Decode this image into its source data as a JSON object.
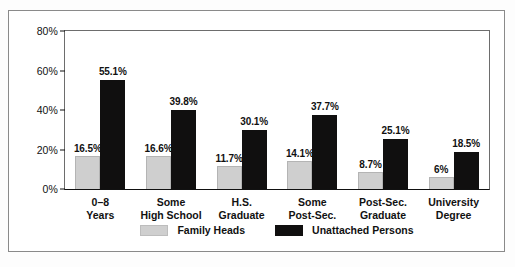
{
  "chart_data": {
    "type": "bar",
    "title": "",
    "subtitle": "",
    "xlabel": "",
    "ylabel": "",
    "ylim": [
      0,
      80
    ],
    "y_ticks": [
      0,
      20,
      40,
      60,
      80
    ],
    "y_tick_labels": [
      "0%",
      "20%",
      "40%",
      "60%",
      "80%"
    ],
    "grid": false,
    "legend_position": "bottom-center",
    "categories": [
      "0–8\nYears",
      "Some\nHigh School",
      "H.S.\nGraduate",
      "Some\nPost-Sec.",
      "Post-Sec.\nGraduate",
      "University\nDegree"
    ],
    "series": [
      {
        "name": "Family Heads",
        "color": "#cfcfcf",
        "values": [
          16.5,
          16.6,
          11.7,
          14.1,
          8.7,
          6.0
        ],
        "value_labels": [
          "16.5%",
          "16.6%",
          "11.7%",
          "14.1%",
          "8.7%",
          "6%"
        ]
      },
      {
        "name": "Unattached Persons",
        "color": "#100f0f",
        "values": [
          55.1,
          39.8,
          30.1,
          37.7,
          25.1,
          18.5
        ],
        "value_labels": [
          "55.1%",
          "39.8%",
          "30.1%",
          "37.7%",
          "25.1%",
          "18.5%"
        ]
      }
    ]
  },
  "legend": {
    "items": [
      {
        "label": "Family Heads",
        "swatch": "family"
      },
      {
        "label": "Unattached Persons",
        "swatch": "unattached"
      }
    ]
  }
}
